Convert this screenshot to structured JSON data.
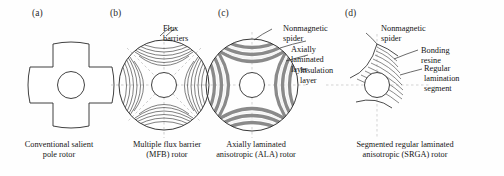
{
  "figure": {
    "type": "technical-diagram",
    "background_color": "#fefefe",
    "line_color": "#2b2b2b",
    "band_color": "#8c8c8c",
    "axis_color": "#b4b4b4"
  },
  "panels": [
    {
      "letter": "(a)",
      "caption": "Conventional salient\npole rotor",
      "rotor_type": "cross-salient-pole",
      "features": [
        "cross-shaped salient poles",
        "central shaft hole",
        "plain outline"
      ],
      "callouts": []
    },
    {
      "letter": "(b)",
      "caption": "Multiple flux barrier\n(MFB) rotor",
      "rotor_type": "multiple-flux-barrier",
      "features": [
        "circular outline",
        "four nested arc families",
        "dashed quadrature axes",
        "central shaft hole"
      ],
      "callouts": [
        {
          "text": "Flux barriers",
          "target": "arc-family-top"
        }
      ]
    },
    {
      "letter": "(c)",
      "caption": "Axially laminated\nanisotropic (ALA) rotor",
      "rotor_type": "axially-laminated-anisotropic",
      "features": [
        "circular outline",
        "thick alternating laminated bands",
        "four lobe pattern",
        "central shaft hole"
      ],
      "callouts": [
        {
          "text": "Nonmagnetic\nspider",
          "target": "rotor-center-top"
        },
        {
          "text": "Axially laminated\nlayer",
          "target": "dark-band"
        },
        {
          "text": "Insulation\nlayer",
          "target": "light-band"
        }
      ]
    },
    {
      "letter": "(d)",
      "caption": "Segmented regular laminated\nanisotropic (SRGA) rotor",
      "rotor_type": "segmented-regular-laminated-anisotropic",
      "features": [
        "single quadrant cutaway",
        "nested lamination segments",
        "curved spider boundary",
        "central shaft hole"
      ],
      "callouts": [
        {
          "text": "Nonmagnetic\nspider",
          "target": "spider-boundary"
        },
        {
          "text": "Bonding resine",
          "target": "resin-gap"
        },
        {
          "text": "Regular lamination\nsegment",
          "target": "lamination-arc"
        }
      ]
    }
  ]
}
